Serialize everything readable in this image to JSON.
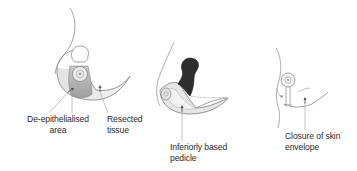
{
  "figure": {
    "panels": [
      {
        "id": "panel-1",
        "description": "Breast with de-epithelialised keyhole area around nipple and resected tissue regions",
        "labels": [
          {
            "name": "de-epithelialised-area-label",
            "lines": [
              "De-epithelialised",
              "area"
            ]
          },
          {
            "name": "resected-tissue-label",
            "lines": [
              "Resected",
              "tissue"
            ]
          }
        ]
      },
      {
        "id": "panel-2",
        "description": "Breast with inferiorly based pedicle, dark upper region showing removed tissue",
        "labels": [
          {
            "name": "inferiorly-based-pedicle-label",
            "lines": [
              "Inferiorly based",
              "pedicle"
            ]
          }
        ]
      },
      {
        "id": "panel-3",
        "description": "Breast after closure with nipple and vertical scar",
        "labels": [
          {
            "name": "closure-of-skin-envelope-label",
            "lines": [
              "Closure of skin",
              "envelope"
            ]
          }
        ]
      }
    ],
    "colors": {
      "line": "#8a8a8a",
      "shade_light": "#d6d6d6",
      "shade_mid": "#a8a8a8",
      "shade_dark": "#2e2e2e",
      "text": "#2a2a2a",
      "background": "#ffffff"
    }
  }
}
